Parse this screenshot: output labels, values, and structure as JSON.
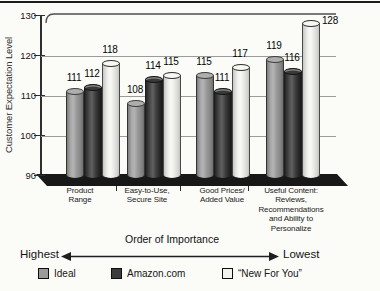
{
  "chart_data": {
    "type": "bar",
    "title": "",
    "ylabel": "Customer Expectation Level",
    "xlabel": "",
    "ylim": [
      90,
      130
    ],
    "yticks": [
      130,
      120,
      110,
      100,
      90
    ],
    "grid": true,
    "legend_position": "bottom",
    "categories": [
      {
        "lines": [
          "Product",
          "Range"
        ]
      },
      {
        "lines": [
          "Easy-to-Use,",
          "Secure Site"
        ]
      },
      {
        "lines": [
          "Good Prices/",
          "Added Value"
        ]
      },
      {
        "lines": [
          "Useful Content:",
          "Reviews,",
          "Recommendations",
          "and Ability to",
          "Personalize"
        ]
      }
    ],
    "series": [
      {
        "name": "Ideal",
        "color": "#9a9a9a",
        "values": [
          111,
          108,
          115,
          119
        ]
      },
      {
        "name": "Amazon.com",
        "color": "#3c3c3c",
        "values": [
          112,
          114,
          111,
          116
        ]
      },
      {
        "name": "“New For You”",
        "color": "#f2f2ee",
        "values": [
          118,
          115,
          117,
          128
        ]
      }
    ]
  },
  "importance_axis": {
    "title": "Order of Importance",
    "left_label": "Highest",
    "right_label": "Lowest"
  },
  "style_colors": {
    "axis": "#2f2f2f",
    "gridline": "#9b9b9b",
    "floor": "#181818",
    "top_rule": "#1c1c1c"
  }
}
